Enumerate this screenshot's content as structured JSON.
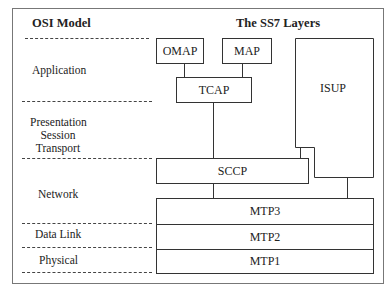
{
  "headers": {
    "osi": "OSI Model",
    "ss7": "The SS7 Layers"
  },
  "osi_layers": {
    "application": "Application",
    "presentation": "Presentation",
    "session": "Session",
    "transport": "Transport",
    "network": "Network",
    "data_link": "Data Link",
    "physical": "Physical"
  },
  "ss7_layers": {
    "omap": "OMAP",
    "map": "MAP",
    "tcap": "TCAP",
    "isup": "ISUP",
    "sccp": "SCCP",
    "mtp3": "MTP3",
    "mtp2": "MTP2",
    "mtp1": "MTP1"
  }
}
